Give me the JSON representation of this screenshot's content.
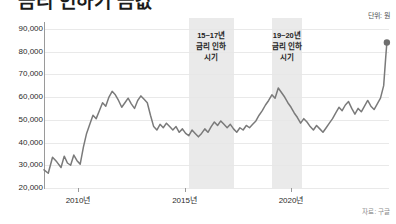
{
  "headline": "금리 인하기 금값",
  "unit_label": "단위: 원",
  "source_label": "자료: 구글",
  "axis": {
    "x_ticks": [
      {
        "label": "2010년",
        "value": 2010
      },
      {
        "label": "2015년",
        "value": 2015
      },
      {
        "label": "2020년",
        "value": 2020
      }
    ],
    "y_ticks": [
      {
        "label": "90,000",
        "value": 90000
      },
      {
        "label": "80,000",
        "value": 80000
      },
      {
        "label": "70,000",
        "value": 70000
      },
      {
        "label": "60,000",
        "value": 60000
      },
      {
        "label": "50,000",
        "value": 50000
      },
      {
        "label": "40,000",
        "value": 40000
      },
      {
        "label": "30,000",
        "value": 30000
      },
      {
        "label": "20,000",
        "value": 20000
      }
    ]
  },
  "bands": [
    {
      "name": "rate-cut-2015-2017",
      "start": 2015.2,
      "end": 2017.3,
      "lines": [
        "15~17년",
        "금리 인하",
        "시기"
      ]
    },
    {
      "name": "rate-cut-2019-2020",
      "start": 2019.1,
      "end": 2020.5,
      "lines": [
        "19~20년",
        "금리 인하",
        "시기"
      ]
    }
  ],
  "colors": {
    "line": "#7a7a7a",
    "band": "#e6e6e6",
    "grid": "#e9e9e9",
    "axis": "#9a9a9a",
    "marker": "#6e6e6e",
    "text": "#222222"
  },
  "chart_data": {
    "type": "line",
    "title": "금리 인하기 금값",
    "xlabel": "",
    "ylabel": "",
    "unit": "원",
    "source": "구글",
    "grid": true,
    "legend": "none",
    "xlim": [
      2008.4,
      2024.6
    ],
    "ylim": [
      20000,
      93000
    ],
    "marker_last_point": true,
    "series": [
      {
        "name": "금값",
        "x": [
          2008.4,
          2008.6,
          2008.8,
          2009.0,
          2009.2,
          2009.35,
          2009.5,
          2009.65,
          2009.8,
          2009.95,
          2010.1,
          2010.25,
          2010.4,
          2010.55,
          2010.7,
          2010.85,
          2011.0,
          2011.15,
          2011.3,
          2011.45,
          2011.6,
          2011.75,
          2011.9,
          2012.05,
          2012.2,
          2012.35,
          2012.5,
          2012.65,
          2012.8,
          2012.95,
          2013.1,
          2013.25,
          2013.4,
          2013.55,
          2013.7,
          2013.85,
          2014.0,
          2014.15,
          2014.3,
          2014.45,
          2014.6,
          2014.75,
          2014.9,
          2015.05,
          2015.2,
          2015.35,
          2015.5,
          2015.65,
          2015.8,
          2015.95,
          2016.1,
          2016.25,
          2016.4,
          2016.55,
          2016.7,
          2016.85,
          2017.0,
          2017.15,
          2017.3,
          2017.45,
          2017.6,
          2017.75,
          2017.9,
          2018.05,
          2018.2,
          2018.35,
          2018.5,
          2018.65,
          2018.8,
          2018.95,
          2019.1,
          2019.25,
          2019.4,
          2019.55,
          2019.7,
          2019.85,
          2020.0,
          2020.15,
          2020.3,
          2020.45,
          2020.6,
          2020.75,
          2020.9,
          2021.05,
          2021.2,
          2021.35,
          2021.5,
          2021.65,
          2021.8,
          2021.95,
          2022.1,
          2022.25,
          2022.4,
          2022.55,
          2022.7,
          2022.85,
          2023.0,
          2023.15,
          2023.3,
          2023.45,
          2023.6,
          2023.75,
          2023.9,
          2024.05,
          2024.2,
          2024.35,
          2024.45,
          2024.5
        ],
        "y": [
          28000,
          26500,
          33500,
          31500,
          29000,
          34000,
          31000,
          30000,
          34500,
          32000,
          30500,
          38000,
          44000,
          48000,
          52000,
          50500,
          54000,
          57500,
          56000,
          60000,
          62500,
          61000,
          58500,
          55500,
          57500,
          59500,
          57000,
          55000,
          58500,
          60500,
          59000,
          57500,
          52000,
          47000,
          45500,
          48000,
          46500,
          48500,
          47000,
          45500,
          47000,
          44500,
          46000,
          44000,
          43000,
          45500,
          44000,
          42500,
          44000,
          46000,
          44500,
          47000,
          49000,
          47500,
          49500,
          48000,
          46500,
          48000,
          46000,
          44500,
          46500,
          45500,
          47500,
          46500,
          48000,
          49500,
          52000,
          54000,
          56500,
          58500,
          61000,
          59500,
          64000,
          62000,
          60000,
          57500,
          55500,
          53000,
          51000,
          48500,
          50500,
          49000,
          47000,
          45500,
          47500,
          46000,
          44500,
          46500,
          48500,
          50500,
          53000,
          55500,
          54000,
          56500,
          58000,
          55000,
          52500,
          55000,
          53500,
          56000,
          58500,
          56000,
          54500,
          57000,
          59500,
          65000,
          78000,
          84000
        ]
      }
    ],
    "annotations": [
      {
        "text": "15~17년 금리 인하 시기",
        "type": "shaded-band",
        "x_start": 2015.2,
        "x_end": 2017.3
      },
      {
        "text": "19~20년 금리 인하 시기",
        "type": "shaded-band",
        "x_start": 2019.1,
        "x_end": 2020.5
      }
    ]
  }
}
